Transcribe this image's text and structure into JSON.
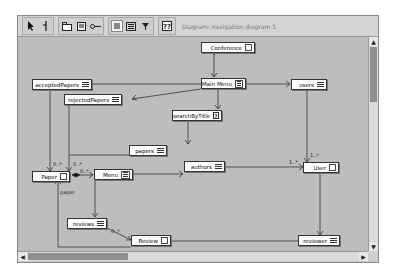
{
  "toolbar": {
    "groups": [
      {
        "buttons": [
          {
            "icon": "select-arrow-icon"
          },
          {
            "icon": "connector-icon"
          }
        ]
      },
      {
        "buttons": [
          {
            "icon": "class-node-icon"
          },
          {
            "icon": "menu-node-icon"
          },
          {
            "icon": "link-icon"
          }
        ]
      },
      {
        "buttons": [
          {
            "icon": "index-icon",
            "active": true
          },
          {
            "icon": "guided-tour-icon"
          },
          {
            "icon": "query-icon"
          }
        ]
      },
      {
        "buttons": [
          {
            "icon": "query-node-icon"
          }
        ]
      }
    ],
    "diagram_label": "Diagram: navigation diagram 1"
  },
  "diagram": {
    "nodes": {
      "conference": {
        "label": "Conference",
        "type": "navigational-class"
      },
      "main_menu": {
        "label": "Main Menu",
        "type": "menu"
      },
      "accepted_papers": {
        "label": "acceptedPapers",
        "type": "index"
      },
      "rejected_papers": {
        "label": "rejectedPapers",
        "type": "index"
      },
      "users": {
        "label": "users",
        "type": "index"
      },
      "search_by_title": {
        "label": "searchByTitle",
        "type": "query"
      },
      "papers": {
        "label": "papers",
        "type": "index"
      },
      "paper": {
        "label": "Paper",
        "type": "navigational-class"
      },
      "menu": {
        "label": "Menu",
        "type": "menu"
      },
      "authors": {
        "label": "authors",
        "type": "index"
      },
      "user": {
        "label": "User",
        "type": "navigational-class"
      },
      "reviews": {
        "label": "reviews",
        "type": "index"
      },
      "review": {
        "label": "Review",
        "type": "navigational-class"
      },
      "reviewer": {
        "label": "reviewer",
        "type": "index"
      }
    },
    "multiplicities": {
      "paper_left": "0..*",
      "paper_right": "0..*",
      "menu_composition": "0..*",
      "user_top": "1..*",
      "user_left": "1..*",
      "review_left": "0..*"
    },
    "edge_labels": {
      "paper_from_review": "paper"
    }
  },
  "scrollbars": {
    "vertical_up": "▲",
    "vertical_down": "▼",
    "horizontal_left": "◀",
    "horizontal_right": "▶"
  }
}
